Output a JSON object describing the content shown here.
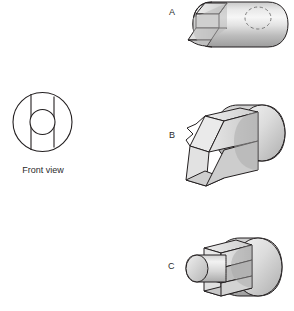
{
  "figure": {
    "type": "orthographic-to-pictorial-matching",
    "background_color": "#ffffff",
    "line_color": "#231f20",
    "front_view": {
      "caption": "Front view",
      "description": "Circle with concentric central hole and a vertical slot band through the middle",
      "outer_circle": {
        "cx": 42.5,
        "cy": 122,
        "r": 29.5
      },
      "inner_hole": {
        "cx": 42.5,
        "cy": 122,
        "r": 12.5
      },
      "slot_lines_x": [
        31,
        54
      ],
      "caption_color": "#2b2b2b"
    },
    "options": [
      {
        "id": "A",
        "label": "A",
        "label_x": 169,
        "label_y": 8,
        "description": "Cylinder with a rectangular notch cut into the near face and a hidden dashed circle on the far cylindrical surface",
        "has_hidden_dashed_circle": true,
        "protrusion": "none"
      },
      {
        "id": "B",
        "label": "B",
        "label_x": 169,
        "label_y": 131,
        "description": "Cylinder with a rectangular key block protruding from the front face",
        "has_hidden_dashed_circle": false,
        "protrusion": "rectangular-block"
      },
      {
        "id": "C",
        "label": "C",
        "label_x": 168,
        "label_y": 262,
        "description": "Cylinder with a slot and a small round cylindrical boss protruding from the front",
        "has_hidden_dashed_circle": false,
        "protrusion": "round-boss"
      }
    ],
    "shading": {
      "cyl_light": "#f2f2f2",
      "cyl_mid": "#d8d8d8",
      "cyl_dark": "#a8a8a8",
      "face_light": "#efefef",
      "face_mid": "#dcdcdc",
      "face_dark": "#b6b6b6",
      "top_face": "#cfcfcf",
      "bottom_face": "#bdbdbd"
    }
  }
}
